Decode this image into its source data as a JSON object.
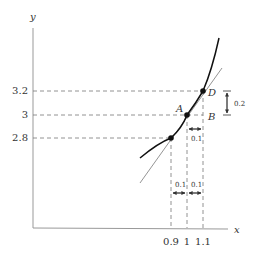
{
  "axes": {
    "x_label": "x",
    "y_label": "y"
  },
  "y_ticks": [
    {
      "label": "3.2",
      "value": 3.2
    },
    {
      "label": "3",
      "value": 3
    },
    {
      "label": "2.8",
      "value": 2.8
    }
  ],
  "x_ticks": [
    {
      "label": "0.9",
      "value": 0.9
    },
    {
      "label": "1",
      "value": 1
    },
    {
      "label": "1.1",
      "value": 1.1
    }
  ],
  "points": [
    {
      "label": "A",
      "x": 1,
      "y": 3
    },
    {
      "label": "B",
      "x": 1.1,
      "y": 3
    },
    {
      "label": "D",
      "x": 1.1,
      "y": 3.2
    }
  ],
  "annotations": {
    "dy": "0.2",
    "dx_top": "0.1",
    "dx_left": "0.1",
    "dx_right": "0.1"
  },
  "colors": {
    "curve": "#111111",
    "tangent": "#888888",
    "dash": "#777777",
    "axis": "#999999"
  }
}
